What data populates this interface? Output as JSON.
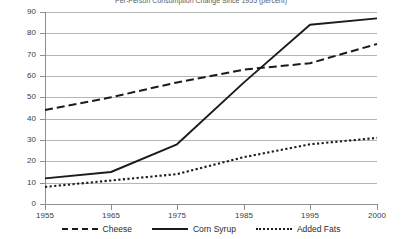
{
  "chart_data": {
    "type": "line",
    "title": "Per-Person Consumption Change Since 1955 (percent)",
    "xlabel": "",
    "ylabel": "",
    "x": [
      1955,
      1965,
      1975,
      1985,
      1995,
      2000
    ],
    "x_tick_labels": [
      "1955",
      "1965",
      "1975",
      "1985",
      "1995",
      "2000"
    ],
    "y_tick_labels": [
      "0",
      "10",
      "20",
      "30",
      "40",
      "50",
      "60",
      "70",
      "80",
      "90"
    ],
    "y_ticks": [
      0,
      10,
      20,
      30,
      40,
      50,
      60,
      70,
      80,
      90
    ],
    "ylim": [
      0,
      90
    ],
    "xlim": [
      1955,
      2000
    ],
    "grid": true,
    "legend_position": "bottom",
    "series": [
      {
        "name": "Cheese",
        "style": "dashed",
        "color": "#1b1b1b",
        "values": [
          44,
          50,
          57,
          63,
          66,
          75
        ]
      },
      {
        "name": "Corn Syrup",
        "style": "solid",
        "color": "#1b1b1b",
        "values": [
          12,
          15,
          28,
          57,
          84,
          87
        ]
      },
      {
        "name": "Added Fats",
        "style": "dotted",
        "color": "#1b1b1b",
        "values": [
          8,
          11,
          14,
          22,
          28,
          31
        ]
      }
    ]
  },
  "legend": {
    "items": [
      {
        "label": "Cheese",
        "swatch": "dashed"
      },
      {
        "label": "Corn Syrup",
        "swatch": "solid"
      },
      {
        "label": "Added Fats",
        "swatch": "dotted"
      }
    ]
  }
}
